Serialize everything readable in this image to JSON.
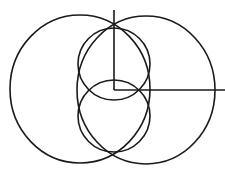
{
  "diagram": {
    "background": "#ffffff",
    "stroke_color": "#1a1a1a",
    "stroke_width": 1.6,
    "shapes": {
      "left_ellipse": {
        "cx": 80,
        "cy": 89,
        "rx": 70,
        "ry": 74
      },
      "right_ellipse": {
        "cx": 146,
        "cy": 90,
        "rx": 69,
        "ry": 74
      },
      "top_circle": {
        "cx": 114,
        "cy": 64,
        "r": 36
      },
      "bottom_circle": {
        "cx": 114,
        "cy": 116,
        "r": 36
      }
    },
    "axes": {
      "vertical": {
        "x1": 114,
        "y1": 10,
        "x2": 114,
        "y2": 90
      },
      "horizontal": {
        "x1": 114,
        "y1": 90,
        "x2": 225,
        "y2": 90
      }
    }
  }
}
